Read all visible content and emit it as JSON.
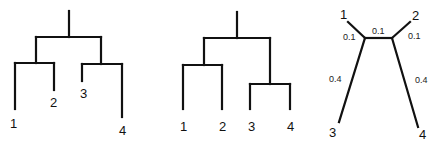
{
  "diagram": {
    "title": "",
    "trees": [
      {
        "id": "unequal-rooted-tree",
        "type": "rooted-phylogram",
        "topology": "((1,2),(3,4))",
        "leaves": [
          {
            "label": "1"
          },
          {
            "label": "2"
          },
          {
            "label": "3"
          },
          {
            "label": "4"
          }
        ]
      },
      {
        "id": "ultrametric-rooted-tree",
        "type": "rooted-cladogram",
        "topology": "((1,2),(3,4))",
        "leaves": [
          {
            "label": "1"
          },
          {
            "label": "2"
          },
          {
            "label": "3"
          },
          {
            "label": "4"
          }
        ]
      },
      {
        "id": "unrooted-tree",
        "type": "unrooted-tree",
        "topology": "((1,3),(2,4))",
        "leaves": [
          {
            "label": "1"
          },
          {
            "label": "2"
          },
          {
            "label": "3"
          },
          {
            "label": "4"
          }
        ],
        "branch_lengths": {
          "leaf1": "0.1",
          "internal": "0.1",
          "leaf2": "0.1",
          "leaf3": "0.4",
          "leaf4": "0.4"
        }
      }
    ],
    "line_color": "#111111"
  }
}
